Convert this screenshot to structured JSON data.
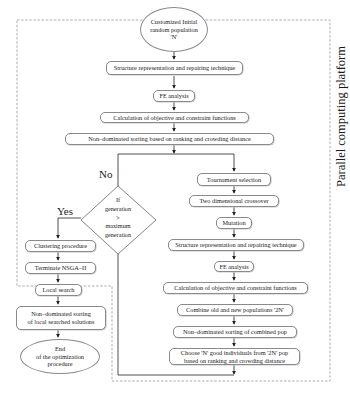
{
  "figure": {
    "platform_label": "Parallel computing platform",
    "start_node": {
      "lines": [
        "Customized Initial",
        "random population",
        "'N'"
      ]
    },
    "main_steps": [
      "Structure representation and repairing technique",
      "FE analysis",
      "Calculation of objective and constraint functions",
      "Non–dominated sorting based on ranking and crowding distance"
    ],
    "decision": {
      "lines": [
        "If",
        "generation",
        ">",
        "maximum",
        "generation"
      ],
      "yes_label": "Yes",
      "no_label": "No"
    },
    "loop_steps": [
      "Tournament selection",
      "Two dimensional crossover",
      "Mutation",
      "Structure representation and repairing technique",
      "FE analysis",
      "Calculation of objective and constraint functions",
      "Combine old and new populations '2N'",
      "Non–dominated sorting of combined pop"
    ],
    "choose_step": {
      "lines": [
        "Choose 'N' good individuals from '2N' pop",
        "based on ranking and crowding distance"
      ]
    },
    "yes_steps": [
      "Clustering procedure",
      "Terminate NSGA–II"
    ],
    "post_steps": [
      "Local search"
    ],
    "post_sort": {
      "lines": [
        "Non–dominated sorting",
        "of local searched solutions"
      ]
    },
    "end_node": {
      "lines": [
        "End",
        "of the optimization",
        "procedure"
      ]
    }
  }
}
